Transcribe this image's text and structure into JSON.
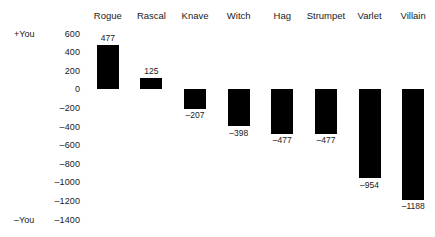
{
  "chart_data": {
    "type": "bar",
    "title": "",
    "xlabel": "",
    "ylabel": "",
    "categories": [
      "Rogue",
      "Rascal",
      "Knave",
      "Witch",
      "Hag",
      "Strumpet",
      "Varlet",
      "Villain"
    ],
    "values": [
      477,
      125,
      -207,
      -398,
      -477,
      -477,
      -954,
      -1188
    ],
    "value_labels": [
      "477",
      "125",
      "–207",
      "–398",
      "–477",
      "–477",
      "–954",
      "–1188"
    ],
    "ylim": [
      -1400,
      600
    ],
    "yticks": [
      600,
      400,
      200,
      0,
      -200,
      -400,
      -600,
      -800,
      -1000,
      -1200,
      -1400
    ],
    "ytick_labels": [
      "600",
      "400",
      "200",
      "0",
      "–200",
      "–400",
      "–600",
      "–800",
      "–1000",
      "–1200",
      "–1400"
    ],
    "axis_endcaps": {
      "top_label": "+You",
      "top_value": 600,
      "bottom_label": "–You",
      "bottom_value": -1400
    },
    "grid": false,
    "legend": null,
    "bar_color": "#000000",
    "category_labels_position": "top"
  }
}
